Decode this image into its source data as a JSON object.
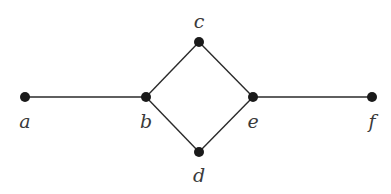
{
  "diagram": {
    "type": "graph",
    "colors": {
      "edge": "#2a2a2a",
      "node": "#1a1a1a",
      "label": "#3a3a3a",
      "background": "#ffffff"
    },
    "nodes": [
      {
        "id": "a",
        "label": "a",
        "x": 25,
        "y": 97,
        "lx": 25,
        "ly": 128
      },
      {
        "id": "b",
        "label": "b",
        "x": 146,
        "y": 97,
        "lx": 146,
        "ly": 128
      },
      {
        "id": "c",
        "label": "c",
        "x": 199,
        "y": 42,
        "lx": 199,
        "ly": 28
      },
      {
        "id": "d",
        "label": "d",
        "x": 199,
        "y": 152,
        "lx": 199,
        "ly": 182
      },
      {
        "id": "e",
        "label": "e",
        "x": 253,
        "y": 97,
        "lx": 253,
        "ly": 128
      },
      {
        "id": "f",
        "label": "f",
        "x": 372,
        "y": 97,
        "lx": 372,
        "ly": 128
      }
    ],
    "edges": [
      {
        "from": "a",
        "to": "b"
      },
      {
        "from": "b",
        "to": "c"
      },
      {
        "from": "b",
        "to": "d"
      },
      {
        "from": "c",
        "to": "e"
      },
      {
        "from": "d",
        "to": "e"
      },
      {
        "from": "e",
        "to": "f"
      }
    ]
  }
}
